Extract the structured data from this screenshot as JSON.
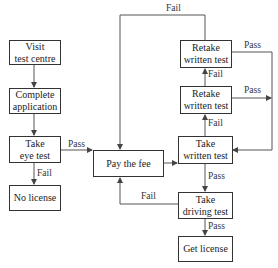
{
  "nodes": {
    "visit": {
      "label": "Visit\ntest centre"
    },
    "complete": {
      "label": "Complete\napplication"
    },
    "eye": {
      "label": "Take\neye test"
    },
    "nolicense": {
      "label": "No license"
    },
    "fee": {
      "label": "Pay the fee"
    },
    "written": {
      "label": "Take\nwritten test"
    },
    "retake1": {
      "label": "Retake\nwritten test"
    },
    "retake2": {
      "label": "Retake\nwritten test"
    },
    "driving": {
      "label": "Take\ndriving test"
    },
    "getlicense": {
      "label": "Get license"
    }
  },
  "edge_labels": {
    "eye_pass": "Pass",
    "eye_fail": "Fail",
    "written_pass": "Pass",
    "written_fail": "Fail",
    "retake1_fail": "Fail",
    "retake1_pass": "Pass",
    "retake2_fail": "Fail",
    "retake2_pass": "Pass",
    "driving_pass": "Pass",
    "driving_fail": "Fail"
  }
}
